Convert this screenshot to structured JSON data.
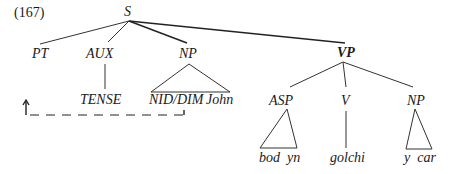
{
  "example_number": "(167)",
  "nodes": {
    "S": "S",
    "PT": "PT",
    "AUX": "AUX",
    "NP_subject": "NP",
    "VP": "VP",
    "TENSE": "TENSE",
    "NID_DIM": "NID/DIM",
    "John": "John",
    "ASP": "ASP",
    "V": "V",
    "NP_object": "NP",
    "bod_yn": "bod  yn",
    "golchi": "golchi",
    "y_car": "y  car"
  },
  "colors": {
    "ink": "#1a1a1a",
    "background": "#ffffff"
  }
}
